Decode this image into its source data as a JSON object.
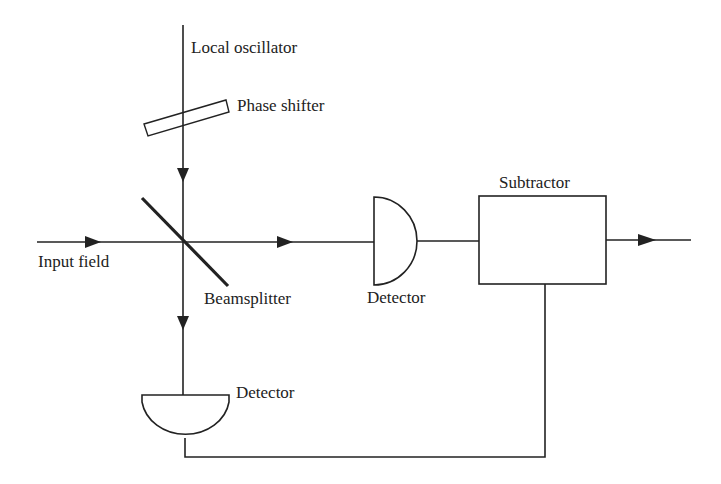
{
  "diagram": {
    "type": "balanced homodyne detection schematic",
    "colors": {
      "line": "#222222",
      "background": "#ffffff"
    },
    "labels": {
      "local_oscillator": "Local oscillator",
      "phase_shifter": "Phase shifter",
      "input_field": "Input field",
      "beamsplitter": "Beamsplitter",
      "detector_right": "Detector",
      "detector_bottom": "Detector",
      "subtractor": "Subtractor"
    },
    "components": [
      {
        "id": "local-oscillator-beam",
        "kind": "beam",
        "direction": "down"
      },
      {
        "id": "phase-shifter",
        "kind": "tilted plate"
      },
      {
        "id": "input-beam",
        "kind": "beam",
        "direction": "right"
      },
      {
        "id": "beamsplitter",
        "kind": "diagonal mirror"
      },
      {
        "id": "detector-right",
        "kind": "photodetector"
      },
      {
        "id": "detector-bottom",
        "kind": "photodetector"
      },
      {
        "id": "subtractor",
        "kind": "box"
      },
      {
        "id": "output-beam",
        "kind": "arrow",
        "direction": "right"
      }
    ]
  }
}
